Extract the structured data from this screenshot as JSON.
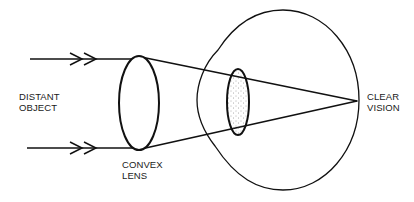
{
  "diagram": {
    "labels": {
      "object": {
        "line1": "DISTANT",
        "line2": "OBJECT"
      },
      "lens": {
        "line1": "CONVEX",
        "line2": "LENS"
      },
      "focus": {
        "line1": "CLEAR",
        "line2": "VISION"
      }
    },
    "elements": [
      {
        "id": "incoming-ray-top",
        "type": "arrow-ray",
        "arrowheads": 2
      },
      {
        "id": "incoming-ray-bottom",
        "type": "arrow-ray",
        "arrowheads": 2
      },
      {
        "id": "convex-lens",
        "type": "ellipse"
      },
      {
        "id": "eyeball",
        "type": "outline"
      },
      {
        "id": "eye-lens",
        "type": "ellipse",
        "fill": "stippled"
      },
      {
        "id": "converging-rays",
        "type": "lines",
        "target": "focal-point"
      }
    ],
    "colors": {
      "stroke": "#111111",
      "background": "#ffffff",
      "stipple": "#555555"
    }
  }
}
